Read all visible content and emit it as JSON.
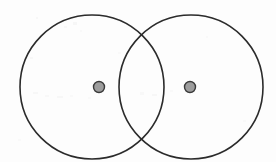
{
  "figure": {
    "title": "Two overlapping circles with marked centers",
    "type": "venn-diagram",
    "background_color": "#fdfdfd",
    "stroke_color": "#2b2b2b",
    "dot_fill_color": "#9d9d9d",
    "dot_stroke_color": "#3a3a3a",
    "canvas": {
      "width": 276,
      "height": 162
    }
  },
  "shapes": {
    "left_circle": {
      "name": "left-circle",
      "cx": 92,
      "cy": 87,
      "r": 72,
      "stroke_width": 1.6,
      "fill": "none"
    },
    "right_circle": {
      "name": "right-circle",
      "cx": 191,
      "cy": 87,
      "r": 72,
      "stroke_width": 1.6,
      "fill": "none"
    },
    "left_center_dot": {
      "name": "left-center-dot",
      "cx": 99,
      "cy": 87,
      "r": 5.5,
      "stroke_width": 1.4
    },
    "right_center_dot": {
      "name": "right-center-dot",
      "cx": 190,
      "cy": 87,
      "r": 5.5,
      "stroke_width": 1.4
    },
    "intersection_points": [
      {
        "name": "upper-intersection",
        "x": 150,
        "y": 31
      },
      {
        "name": "lower-intersection",
        "x": 150,
        "y": 143
      }
    ]
  },
  "specks": [
    {
      "x": 36,
      "y": 17,
      "w": 2,
      "h": 2,
      "o": 0.12
    },
    {
      "x": 64,
      "y": 26,
      "w": 3,
      "h": 2,
      "o": 0.1
    },
    {
      "x": 73,
      "y": 22,
      "w": 4,
      "h": 3,
      "o": 0.14
    },
    {
      "x": 80,
      "y": 30,
      "w": 2,
      "h": 2,
      "o": 0.09
    },
    {
      "x": 30,
      "y": 57,
      "w": 3,
      "h": 2,
      "o": 0.11
    },
    {
      "x": 33,
      "y": 92,
      "w": 5,
      "h": 2,
      "o": 0.13
    },
    {
      "x": 45,
      "y": 95,
      "w": 4,
      "h": 2,
      "o": 0.1
    },
    {
      "x": 57,
      "y": 96,
      "w": 6,
      "h": 2,
      "o": 0.12
    },
    {
      "x": 70,
      "y": 95,
      "w": 3,
      "h": 2,
      "o": 0.09
    },
    {
      "x": 88,
      "y": 97,
      "w": 3,
      "h": 2,
      "o": 0.08
    },
    {
      "x": 140,
      "y": 92,
      "w": 4,
      "h": 3,
      "o": 0.1
    },
    {
      "x": 152,
      "y": 94,
      "w": 5,
      "h": 2,
      "o": 0.11
    },
    {
      "x": 170,
      "y": 90,
      "w": 3,
      "h": 2,
      "o": 0.08
    },
    {
      "x": 118,
      "y": 52,
      "w": 3,
      "h": 2,
      "o": 0.09
    },
    {
      "x": 206,
      "y": 36,
      "w": 2,
      "h": 2,
      "o": 0.08
    },
    {
      "x": 243,
      "y": 120,
      "w": 3,
      "h": 2,
      "o": 0.09
    },
    {
      "x": 18,
      "y": 139,
      "w": 3,
      "h": 2,
      "o": 0.08
    },
    {
      "x": 258,
      "y": 60,
      "w": 2,
      "h": 3,
      "o": 0.08
    }
  ]
}
